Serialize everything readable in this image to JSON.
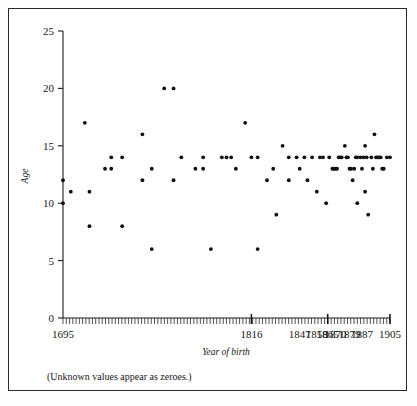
{
  "figure": {
    "caption": "(Unknown values appear as zeroes.)"
  },
  "chart_data": {
    "type": "scatter",
    "title": "",
    "xlabel": "Year of birth",
    "ylabel": "Age",
    "xlim": [
      1695,
      1905
    ],
    "ylim": [
      0,
      25
    ],
    "grid": false,
    "legend": "none",
    "y_ticks": [
      0,
      5,
      10,
      15,
      20,
      25
    ],
    "x_tick_labels": [
      "1695",
      "1816",
      "1847",
      "1858",
      "1865",
      "1870",
      "1879",
      "1887",
      "1905"
    ],
    "x_tick_positions": [
      1695,
      1816,
      1847,
      1858,
      1865,
      1870,
      1879,
      1887,
      1905
    ],
    "x_axis_note": "Dense minor tick marks span the axis; three taller ticks mark category breaks.",
    "points": [
      {
        "x": 1695,
        "y": 10
      },
      {
        "x": 1695,
        "y": 12
      },
      {
        "x": 1700,
        "y": 11
      },
      {
        "x": 1709,
        "y": 17
      },
      {
        "x": 1712,
        "y": 11
      },
      {
        "x": 1712,
        "y": 8
      },
      {
        "x": 1722,
        "y": 13
      },
      {
        "x": 1726,
        "y": 13
      },
      {
        "x": 1726,
        "y": 14
      },
      {
        "x": 1733,
        "y": 14
      },
      {
        "x": 1733,
        "y": 8
      },
      {
        "x": 1746,
        "y": 16
      },
      {
        "x": 1746,
        "y": 12
      },
      {
        "x": 1752,
        "y": 13
      },
      {
        "x": 1752,
        "y": 6
      },
      {
        "x": 1760,
        "y": 20
      },
      {
        "x": 1766,
        "y": 20
      },
      {
        "x": 1766,
        "y": 12
      },
      {
        "x": 1771,
        "y": 14
      },
      {
        "x": 1780,
        "y": 13
      },
      {
        "x": 1785,
        "y": 14
      },
      {
        "x": 1785,
        "y": 13
      },
      {
        "x": 1790,
        "y": 6
      },
      {
        "x": 1797,
        "y": 14
      },
      {
        "x": 1800,
        "y": 14
      },
      {
        "x": 1803,
        "y": 14
      },
      {
        "x": 1806,
        "y": 13
      },
      {
        "x": 1812,
        "y": 17
      },
      {
        "x": 1816,
        "y": 14
      },
      {
        "x": 1820,
        "y": 14
      },
      {
        "x": 1820,
        "y": 6
      },
      {
        "x": 1826,
        "y": 12
      },
      {
        "x": 1830,
        "y": 13
      },
      {
        "x": 1832,
        "y": 9
      },
      {
        "x": 1836,
        "y": 15
      },
      {
        "x": 1840,
        "y": 14
      },
      {
        "x": 1840,
        "y": 12
      },
      {
        "x": 1845,
        "y": 14
      },
      {
        "x": 1847,
        "y": 13
      },
      {
        "x": 1850,
        "y": 14
      },
      {
        "x": 1852,
        "y": 12
      },
      {
        "x": 1855,
        "y": 14
      },
      {
        "x": 1858,
        "y": 11
      },
      {
        "x": 1860,
        "y": 14
      },
      {
        "x": 1862,
        "y": 14
      },
      {
        "x": 1864,
        "y": 10
      },
      {
        "x": 1866,
        "y": 14
      },
      {
        "x": 1868,
        "y": 13
      },
      {
        "x": 1869,
        "y": 13
      },
      {
        "x": 1870,
        "y": 13
      },
      {
        "x": 1871,
        "y": 13
      },
      {
        "x": 1872,
        "y": 14
      },
      {
        "x": 1873,
        "y": 14
      },
      {
        "x": 1874,
        "y": 14
      },
      {
        "x": 1876,
        "y": 15
      },
      {
        "x": 1877,
        "y": 14
      },
      {
        "x": 1878,
        "y": 14
      },
      {
        "x": 1879,
        "y": 13
      },
      {
        "x": 1880,
        "y": 13
      },
      {
        "x": 1881,
        "y": 12
      },
      {
        "x": 1882,
        "y": 13
      },
      {
        "x": 1883,
        "y": 14
      },
      {
        "x": 1884,
        "y": 14
      },
      {
        "x": 1884,
        "y": 10
      },
      {
        "x": 1886,
        "y": 14
      },
      {
        "x": 1887,
        "y": 13
      },
      {
        "x": 1888,
        "y": 14
      },
      {
        "x": 1889,
        "y": 15
      },
      {
        "x": 1889,
        "y": 11
      },
      {
        "x": 1890,
        "y": 14
      },
      {
        "x": 1891,
        "y": 9
      },
      {
        "x": 1893,
        "y": 14
      },
      {
        "x": 1894,
        "y": 13
      },
      {
        "x": 1895,
        "y": 16
      },
      {
        "x": 1896,
        "y": 14
      },
      {
        "x": 1897,
        "y": 14
      },
      {
        "x": 1898,
        "y": 14
      },
      {
        "x": 1899,
        "y": 14
      },
      {
        "x": 1900,
        "y": 13
      },
      {
        "x": 1901,
        "y": 13
      },
      {
        "x": 1903,
        "y": 14
      },
      {
        "x": 1905,
        "y": 14
      }
    ]
  }
}
